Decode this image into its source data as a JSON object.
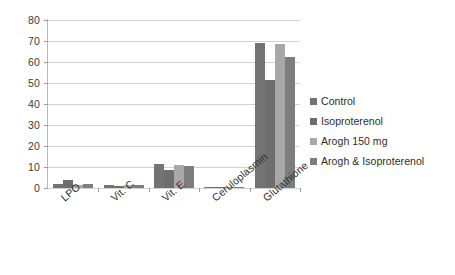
{
  "chart_data": {
    "type": "bar",
    "title": "",
    "subtitle": "",
    "xlabel": "",
    "ylabel": "",
    "ylim": [
      0,
      80
    ],
    "yticks": [
      0,
      10,
      20,
      30,
      40,
      50,
      60,
      70,
      80
    ],
    "ytick_labels": [
      "0",
      "10",
      "20",
      "30",
      "40",
      "50",
      "60",
      "70",
      "80"
    ],
    "grid": true,
    "legend_position": "right",
    "categories": [
      "LPO",
      "Vit. C",
      "Vit. E",
      "Ceruloplasmin",
      "Glutathione"
    ],
    "series": [
      {
        "name": "Control",
        "color": "#737373",
        "values": [
          1.8,
          1.4,
          11.5,
          0.4,
          69.2
        ]
      },
      {
        "name": "Isoproterenol",
        "color": "#6e6e6e",
        "values": [
          3.6,
          1.1,
          8.5,
          0.3,
          51.2
        ]
      },
      {
        "name": "Arogh 150 mg",
        "color": "#a8a8a8",
        "values": [
          1.4,
          1.6,
          10.9,
          0.4,
          68.5
        ]
      },
      {
        "name": "Arogh & Isoproterenol",
        "color": "#7d7d7d",
        "values": [
          1.7,
          1.3,
          10.3,
          0.4,
          62.5
        ]
      }
    ]
  },
  "legend": {
    "items": [
      {
        "label": "Control",
        "color": "#737373"
      },
      {
        "label": "Isoproterenol",
        "color": "#6e6e6e"
      },
      {
        "label": "Arogh 150 mg",
        "color": "#a8a8a8"
      },
      {
        "label": "Arogh & Isoproterenol",
        "color": "#7d7d7d"
      }
    ]
  }
}
